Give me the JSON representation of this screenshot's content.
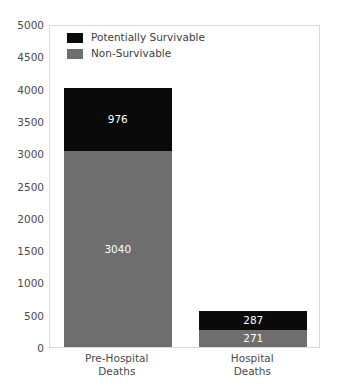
{
  "chart_data": {
    "type": "bar",
    "stacked": true,
    "title": "",
    "xlabel": "",
    "ylabel": "",
    "ylim": [
      0,
      5000
    ],
    "ytick_step": 500,
    "yticks": [
      "5000",
      "4500",
      "4000",
      "3500",
      "3000",
      "2500",
      "2000",
      "1500",
      "1000",
      "500",
      "0"
    ],
    "categories": [
      "Pre-Hospital\nDeaths",
      "Hospital\nDeaths"
    ],
    "category_lines": [
      [
        "Pre-Hospital",
        "Deaths"
      ],
      [
        "Hospital",
        "Deaths"
      ]
    ],
    "legend_position": "upper left",
    "grid": false,
    "series": [
      {
        "name": "Non-Survivable",
        "color": "#6e6e6e",
        "values": [
          3040,
          271
        ],
        "labels": [
          "3040",
          "271"
        ]
      },
      {
        "name": "Potentially Survivable",
        "color": "#0a0a0a",
        "values": [
          976,
          287
        ],
        "labels": [
          "976",
          "287"
        ]
      }
    ],
    "totals": [
      4016,
      558
    ]
  },
  "legend": {
    "items": [
      {
        "label": "Potentially Survivable",
        "color": "#0a0a0a"
      },
      {
        "label": "Non-Survivable",
        "color": "#6e6e6e"
      }
    ]
  },
  "axes": {
    "y_ticks": [
      {
        "label": "5000",
        "value": 5000
      },
      {
        "label": "4500",
        "value": 4500
      },
      {
        "label": "4000",
        "value": 4000
      },
      {
        "label": "3500",
        "value": 3500
      },
      {
        "label": "3000",
        "value": 3000
      },
      {
        "label": "2500",
        "value": 2500
      },
      {
        "label": "2000",
        "value": 2000
      },
      {
        "label": "1500",
        "value": 1500
      },
      {
        "label": "1000",
        "value": 1000
      },
      {
        "label": "500",
        "value": 500
      },
      {
        "label": "0",
        "value": 0
      }
    ],
    "x_ticks": [
      {
        "line1": "Pre-Hospital",
        "line2": "Deaths"
      },
      {
        "line1": "Hospital",
        "line2": "Deaths"
      }
    ]
  },
  "bars": [
    {
      "category": "Pre-Hospital Deaths",
      "segments": [
        {
          "name": "Potentially Survivable",
          "value": 976,
          "label": "976",
          "color": "#0a0a0a"
        },
        {
          "name": "Non-Survivable",
          "value": 3040,
          "label": "3040",
          "color": "#6e6e6e"
        }
      ]
    },
    {
      "category": "Hospital Deaths",
      "segments": [
        {
          "name": "Potentially Survivable",
          "value": 287,
          "label": "287",
          "color": "#0a0a0a"
        },
        {
          "name": "Non-Survivable",
          "value": 271,
          "label": "271",
          "color": "#6e6e6e"
        }
      ]
    }
  ],
  "colors": {
    "potentially_survivable": "#0a0a0a",
    "non_survivable": "#6e6e6e",
    "plot_border": "#d8d8d8",
    "background": "#ffffff",
    "tick_text": "#4a4a4a"
  }
}
